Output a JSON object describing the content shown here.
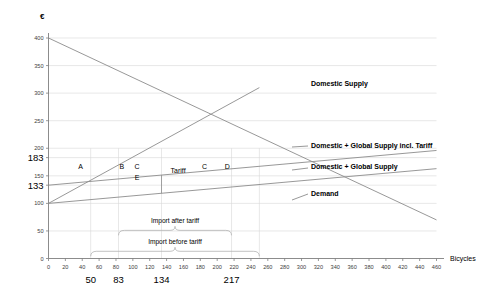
{
  "chart_data": {
    "type": "line",
    "title": "",
    "xlabel": "Bicycles",
    "ylabel": "€",
    "xlim": [
      0,
      460
    ],
    "ylim": [
      0,
      400
    ],
    "grid": true,
    "legend_position": "right-inline",
    "x_ticks": [
      0,
      20,
      40,
      60,
      80,
      100,
      120,
      140,
      160,
      180,
      200,
      220,
      240,
      260,
      280,
      300,
      320,
      340,
      360,
      380,
      400,
      420,
      440,
      460
    ],
    "y_ticks": [
      0,
      50,
      100,
      150,
      200,
      250,
      300,
      350,
      400
    ],
    "highlight_y_values": [
      183,
      133
    ],
    "highlight_x_values": [
      50,
      83,
      134,
      217
    ],
    "series": [
      {
        "name": "Demand",
        "points": [
          [
            0,
            400
          ],
          [
            460,
            70
          ]
        ],
        "label": "Demand"
      },
      {
        "name": "Domestic Supply",
        "points": [
          [
            0,
            100
          ],
          [
            250,
            310
          ]
        ],
        "label": "Domestic Supply"
      },
      {
        "name": "Domestic + Global Supply incl. Tariff",
        "points": [
          [
            0,
            133
          ],
          [
            460,
            196
          ]
        ],
        "label": "Domestic + Global Supply incl. Tariff"
      },
      {
        "name": "Domestic + Global Supply",
        "points": [
          [
            0,
            100
          ],
          [
            460,
            163
          ]
        ],
        "label": "Domestic + Global Supply"
      }
    ],
    "region_labels": [
      {
        "text": "A",
        "x": 38,
        "y": 163
      },
      {
        "text": "B",
        "x": 87,
        "y": 163
      },
      {
        "text": "C",
        "x": 105,
        "y": 163
      },
      {
        "text": "E",
        "x": 105,
        "y": 143
      },
      {
        "text": "C",
        "x": 185,
        "y": 163
      },
      {
        "text": "D",
        "x": 212,
        "y": 163
      }
    ],
    "annotations": [
      {
        "text": "Tariff",
        "x": 143,
        "y": 156
      },
      {
        "text": "Import after tariff",
        "x": 150,
        "y": 104
      },
      {
        "text": "Import before tariff",
        "x": 150,
        "y": 60
      }
    ],
    "brackets": [
      {
        "label": "Import after tariff",
        "from_x": 83,
        "to_x": 217
      },
      {
        "label": "Import before tariff",
        "from_x": 50,
        "to_x": 250
      }
    ]
  },
  "colors": {
    "curve": "#8c8c8c",
    "axis": "#7f7f7f",
    "grid": "#d9d9d9",
    "text": "#1a1a1a",
    "background": "#ffffff"
  }
}
